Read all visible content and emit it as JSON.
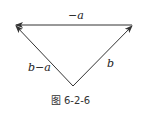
{
  "diagram": {
    "type": "vector-triangle",
    "caption": "图 6-2-6",
    "vectors": [
      {
        "name": "minus-a",
        "label": "−a",
        "from": "right-vertex",
        "to": "left-vertex"
      },
      {
        "name": "b",
        "label": "b",
        "from": "bottom-vertex",
        "to": "right-vertex"
      },
      {
        "name": "b-minus-a",
        "label": "b−a",
        "from": "bottom-vertex",
        "to": "left-vertex"
      }
    ],
    "colors": {
      "stroke": "#333333",
      "text": "#222222"
    }
  }
}
